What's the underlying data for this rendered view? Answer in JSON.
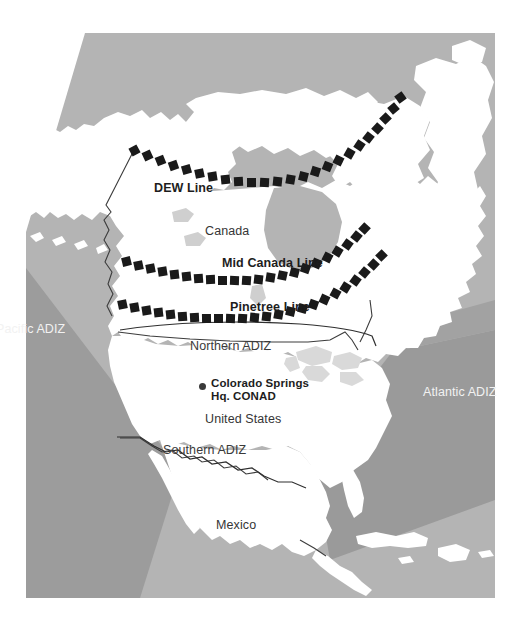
{
  "figure": {
    "type": "map",
    "width": 518,
    "height": 622
  },
  "colors": {
    "page_background": "#ffffff",
    "ocean": "#b4b4b4",
    "land": "#ffffff",
    "adiz_band": "#9a9a9a",
    "lake": "#d9d9d9",
    "radar_dash": "#1a1a1a",
    "border_line": "#3c3c3c",
    "label_dark": "#2b2b2b",
    "label_light": "#f2f2f2"
  },
  "radar_lines": [
    {
      "id": "dew-line",
      "label": "DEW Line",
      "label_x": 154,
      "label_y": 181
    },
    {
      "id": "mid-canada-line",
      "label": "Mid Canada Line",
      "label_x": 222,
      "label_y": 256
    },
    {
      "id": "pinetree-line",
      "label": "Pinetree Line",
      "label_x": 230,
      "label_y": 301
    }
  ],
  "adiz_zones": [
    {
      "id": "pacific-adiz",
      "label": "Pacific ADIZ",
      "label_x": -4,
      "label_y": 322,
      "style": "light"
    },
    {
      "id": "atlantic-adiz",
      "label": "Atlantic ADIZ",
      "label_x": 423,
      "label_y": 385,
      "style": "light"
    },
    {
      "id": "northern-adiz",
      "label": "Northern ADIZ",
      "label_x": 190,
      "label_y": 339,
      "style": "dark"
    },
    {
      "id": "southern-adiz",
      "label": "Southern ADIZ",
      "label_x": 163,
      "label_y": 444,
      "style": "dark"
    }
  ],
  "countries": [
    {
      "id": "canada",
      "label": "Canada",
      "label_x": 205,
      "label_y": 225
    },
    {
      "id": "united-states",
      "label": "United States",
      "label_x": 205,
      "label_y": 413
    },
    {
      "id": "mexico",
      "label": "Mexico",
      "label_x": 216,
      "label_y": 519
    }
  ],
  "cities": [
    {
      "id": "colorado-springs",
      "label_line1": "Colorado Springs",
      "label_line2": "Hq. CONAD",
      "marker_x": 199,
      "marker_y": 383,
      "label_x": 211,
      "label_y": 377
    }
  ]
}
